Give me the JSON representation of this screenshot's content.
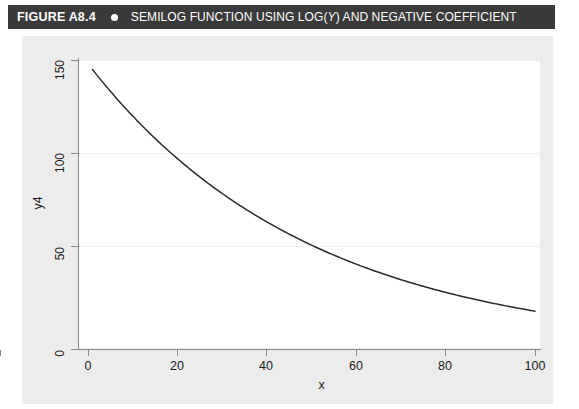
{
  "header": {
    "figure_number": "FIGURE A8.4",
    "bullet_icon": "filled-circle-icon",
    "title_prefix": "SEMILOG FUNCTION USING LOG(",
    "title_italic": "Y",
    "title_suffix": ") AND NEGATIVE COEFFICIENT",
    "full_title": "SEMILOG FUNCTION USING LOG(Y) AND NEGATIVE COEFFICIENT",
    "background_color": "#3a3a3a",
    "text_color": "#ffffff"
  },
  "figure": {
    "background_color": "#ececed",
    "panel_color": "#ffffff",
    "gridline_color": "#f3eef1",
    "axis_color": "#8a8a8a",
    "curve_color": "#2b2b2b"
  },
  "chart_data": {
    "type": "line",
    "title": "SEMILOG FUNCTION USING LOG(Y) AND NEGATIVE COEFFICIENT",
    "xlabel": "x",
    "ylabel": "y4",
    "xlim": [
      0,
      100
    ],
    "ylim": [
      0,
      155
    ],
    "xticks": [
      0,
      20,
      40,
      60,
      80,
      100
    ],
    "xtick_labels": [
      "0",
      "20",
      "40",
      "60",
      "80",
      "100"
    ],
    "yticks": [
      0,
      50,
      100,
      150
    ],
    "ytick_labels": [
      "0",
      "50",
      "100",
      "150"
    ],
    "grid": "horizontal-only",
    "legend": "none",
    "series": [
      {
        "name": "y4",
        "equation": "y4 = 148 * exp(-0.0202 * x)",
        "x": [
          1,
          5,
          10,
          15,
          20,
          25,
          30,
          35,
          40,
          45,
          50,
          55,
          60,
          65,
          70,
          75,
          80,
          85,
          90,
          95,
          100
        ],
        "values": [
          145.0,
          133.8,
          120.9,
          109.3,
          98.8,
          89.3,
          80.7,
          73.0,
          66.0,
          59.6,
          53.9,
          48.7,
          44.0,
          39.8,
          36.0,
          32.5,
          29.4,
          26.6,
          24.0,
          21.7,
          19.6
        ]
      }
    ]
  },
  "axes": {
    "y_tick_labels": [
      "150",
      "100",
      "50",
      "0"
    ],
    "x_tick_labels": [
      "0",
      "20",
      "40",
      "60",
      "80",
      "100"
    ],
    "y_title": "y4",
    "x_title": "x"
  }
}
